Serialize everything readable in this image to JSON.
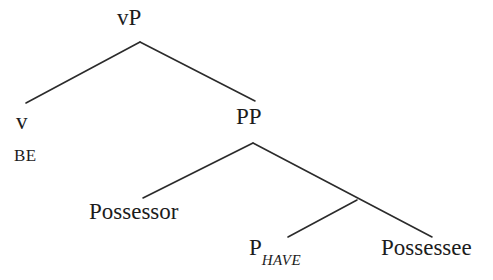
{
  "figure": {
    "kind": "syntactic-tree-diagram",
    "background_color": "#ffffff",
    "line_color": "#2b2b2b",
    "text_color": "#1c1c1c",
    "width": 493,
    "height": 280
  },
  "nodes": {
    "root": {
      "label": "vP",
      "x": 140,
      "y": 20
    },
    "v_head": {
      "label": "v",
      "x": 22,
      "y": 120
    },
    "v_lexical": {
      "label": "BE",
      "x": 27,
      "y": 155
    },
    "pp": {
      "label": "PP",
      "x": 254,
      "y": 118
    },
    "possessor": {
      "label": "Possessor",
      "x": 146,
      "y": 213
    },
    "p_have": {
      "label_main": "P",
      "label_sub": "HAVE",
      "x": 292,
      "y": 250
    },
    "possessee": {
      "label": "Possessee",
      "x": 434,
      "y": 250
    }
  },
  "edges": [
    {
      "name": "vP-to-v",
      "from": "root",
      "to": "v_head",
      "x1": 140,
      "y1": 42,
      "x2": 26,
      "y2": 103
    },
    {
      "name": "vP-to-PP",
      "from": "root",
      "to": "pp",
      "x1": 140,
      "y1": 42,
      "x2": 255,
      "y2": 101
    },
    {
      "name": "PP-to-Possessor",
      "from": "pp",
      "to": "possessor",
      "x1": 253,
      "y1": 143,
      "x2": 143,
      "y2": 198
    },
    {
      "name": "PP-to-Pbar",
      "from": "pp",
      "to": "p_bar",
      "x1": 253,
      "y1": 143,
      "x2": 432,
      "y2": 237
    },
    {
      "name": "Pbar-to-PHAVE",
      "from": "p_bar",
      "to": "p_have",
      "x1": 357,
      "y1": 200,
      "x2": 288,
      "y2": 237
    }
  ],
  "labels": {
    "vp": "vP",
    "v": "v",
    "be": "BE",
    "pp": "PP",
    "possessor": "Possessor",
    "p_main": "P",
    "p_subscript": "HAVE",
    "possessee": "Possessee"
  }
}
